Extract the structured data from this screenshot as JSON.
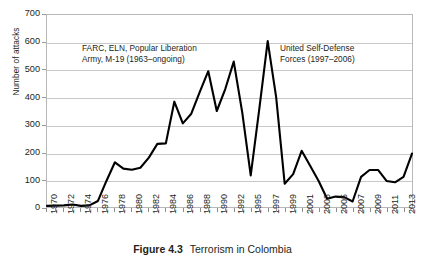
{
  "figure": {
    "caption_label": "Figure 4.3",
    "caption_text": "Terrorism in Colombia"
  },
  "annotations": {
    "left": "FARC, ELN, Popular Liberation\nArmy, M-19 (1963–ongoing)",
    "right": "United Self-Defense\nForces (1997–2006)"
  },
  "colors": {
    "series_line": "#000000",
    "gridline": "#c9c9c9",
    "plot_border": "#b8b8b8",
    "text": "#231f20",
    "background": "#ffffff"
  },
  "chart_data": {
    "type": "line",
    "title": "",
    "xlabel": "",
    "ylabel": "Number of attacks",
    "ylim": [
      0,
      700
    ],
    "ytick_labels": [
      "0",
      "100",
      "200",
      "300",
      "400",
      "500",
      "600",
      "700"
    ],
    "ytick_values": [
      0,
      100,
      200,
      300,
      400,
      500,
      600,
      700
    ],
    "grid": true,
    "legend": "none",
    "note": "Year 1993 is absent from the dataset; axis labels show every second year.",
    "x": [
      "1970",
      "1971",
      "1972",
      "1973",
      "1974",
      "1975",
      "1976",
      "1977",
      "1978",
      "1979",
      "1980",
      "1981",
      "1982",
      "1983",
      "1984",
      "1985",
      "1986",
      "1987",
      "1988",
      "1989",
      "1990",
      "1991",
      "1992",
      "1994",
      "1995",
      "1996",
      "1997",
      "1998",
      "1999",
      "2000",
      "2001",
      "2002",
      "2003",
      "2004",
      "2005",
      "2006",
      "2007",
      "2008",
      "2009",
      "2010",
      "2011",
      "2012",
      "2013",
      "2014"
    ],
    "xtick_labels": [
      "1970",
      "1972",
      "1974",
      "1976",
      "1978",
      "1980",
      "1982",
      "1984",
      "1986",
      "1988",
      "1990",
      "1992",
      "1995",
      "1997",
      "1999",
      "2001",
      "2003",
      "2005",
      "2007",
      "2009",
      "2011",
      "2013"
    ],
    "series": [
      {
        "name": "Number of attacks",
        "values": [
          4,
          5,
          6,
          9,
          4,
          6,
          22,
          95,
          163,
          140,
          136,
          143,
          180,
          230,
          232,
          384,
          305,
          340,
          420,
          495,
          350,
          430,
          530,
          345,
          115,
          355,
          605,
          400,
          85,
          120,
          205,
          150,
          95,
          30,
          38,
          36,
          20,
          110,
          135,
          135,
          95,
          90,
          110,
          195
        ]
      }
    ]
  }
}
